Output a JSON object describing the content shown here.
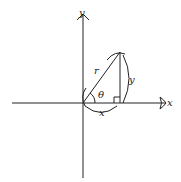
{
  "diagram": {
    "type": "polar-coordinates-right-triangle",
    "axes": {
      "x_label": "x",
      "y_label": "y"
    },
    "triangle": {
      "hypotenuse_label": "r",
      "adjacent_label": "x",
      "opposite_label": "y",
      "angle_label": "θ",
      "right_angle_marker": true
    },
    "colors": {
      "stroke": "#222222",
      "background": "#ffffff"
    }
  }
}
